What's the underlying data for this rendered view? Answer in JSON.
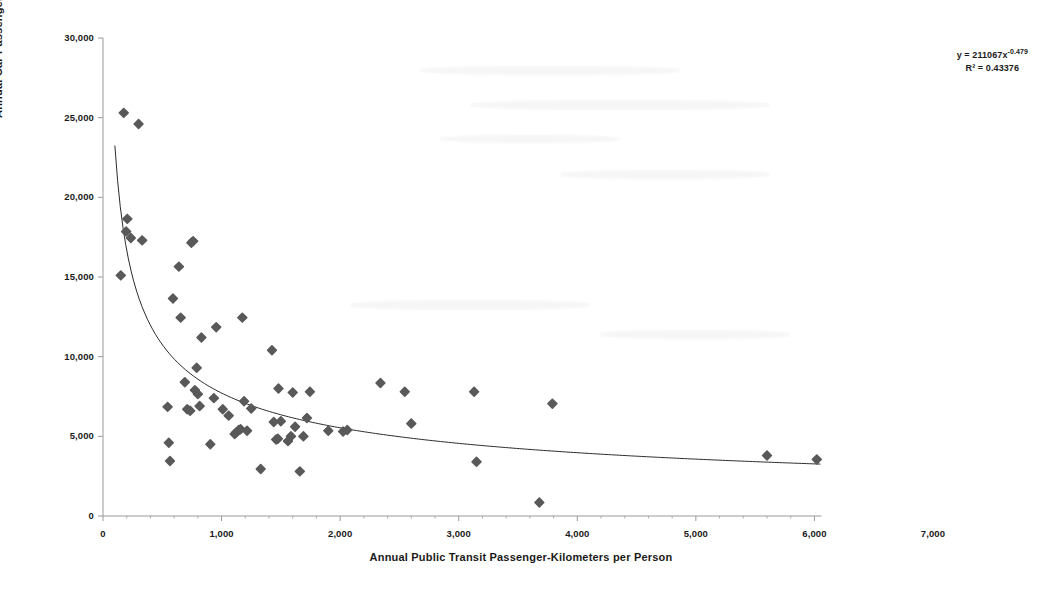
{
  "chart_data": {
    "type": "scatter",
    "title": "",
    "xlabel": "Annual Public Transit Passenger-Kilometers per Person",
    "ylabel": "Annual Car Passenger-Kilometers per Person",
    "xlim": [
      0,
      7000
    ],
    "ylim": [
      0,
      30000
    ],
    "xticks": [
      "0",
      "1,000",
      "2,000",
      "3,000",
      "4,000",
      "5,000",
      "6,000",
      "7,000"
    ],
    "xtick_values": [
      0,
      1000,
      2000,
      3000,
      4000,
      5000,
      6000,
      7000
    ],
    "yticks": [
      "0",
      "5,000",
      "10,000",
      "15,000",
      "20,000",
      "25,000",
      "30,000"
    ],
    "ytick_values": [
      0,
      5000,
      10000,
      15000,
      20000,
      25000,
      30000
    ],
    "grid": false,
    "legend": false,
    "minor_ticks_x": 200,
    "marker": {
      "shape": "diamond",
      "color": "#595959",
      "size": 7
    },
    "annotation": {
      "equation": "y = 211067x",
      "exponent": "-0.479",
      "r_squared": "R² = 0.43376"
    },
    "trendline": {
      "type": "power",
      "color": "#2b2b2b",
      "width": 1,
      "coefficient": 211067,
      "exponent": -0.479,
      "x_start": 100,
      "x_end": 6050
    },
    "points": [
      [
        150,
        15100
      ],
      [
        175,
        25300
      ],
      [
        205,
        18650
      ],
      [
        195,
        17850
      ],
      [
        235,
        17450
      ],
      [
        300,
        24600
      ],
      [
        330,
        17300
      ],
      [
        545,
        6850
      ],
      [
        555,
        4600
      ],
      [
        565,
        3450
      ],
      [
        590,
        13650
      ],
      [
        640,
        15650
      ],
      [
        655,
        12450
      ],
      [
        690,
        8400
      ],
      [
        710,
        6700
      ],
      [
        735,
        6600
      ],
      [
        745,
        17150
      ],
      [
        760,
        17250
      ],
      [
        775,
        7900
      ],
      [
        790,
        9300
      ],
      [
        800,
        7650
      ],
      [
        815,
        6900
      ],
      [
        830,
        11200
      ],
      [
        905,
        4500
      ],
      [
        935,
        7400
      ],
      [
        955,
        11850
      ],
      [
        1010,
        6700
      ],
      [
        1060,
        6300
      ],
      [
        1110,
        5150
      ],
      [
        1125,
        5250
      ],
      [
        1145,
        5400
      ],
      [
        1160,
        5450
      ],
      [
        1175,
        12450
      ],
      [
        1190,
        7200
      ],
      [
        1215,
        5350
      ],
      [
        1250,
        6750
      ],
      [
        1330,
        2950
      ],
      [
        1425,
        10400
      ],
      [
        1440,
        5900
      ],
      [
        1460,
        4800
      ],
      [
        1475,
        4850
      ],
      [
        1480,
        8000
      ],
      [
        1500,
        5950
      ],
      [
        1560,
        4700
      ],
      [
        1585,
        5000
      ],
      [
        1600,
        7750
      ],
      [
        1620,
        5600
      ],
      [
        1660,
        2800
      ],
      [
        1690,
        5000
      ],
      [
        1720,
        6150
      ],
      [
        1745,
        7800
      ],
      [
        1900,
        5350
      ],
      [
        2025,
        5300
      ],
      [
        2060,
        5400
      ],
      [
        2340,
        8350
      ],
      [
        2545,
        7800
      ],
      [
        2600,
        5800
      ],
      [
        3130,
        7800
      ],
      [
        3150,
        3400
      ],
      [
        3680,
        850
      ],
      [
        3790,
        7050
      ],
      [
        5600,
        3800
      ],
      [
        6020,
        3550
      ]
    ]
  }
}
